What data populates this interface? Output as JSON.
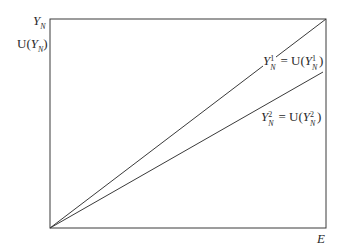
{
  "diagram": {
    "y_axis": {
      "top_label": "Y",
      "top_label_sub": "N",
      "second_label_prefix": "U(",
      "second_label_var": "Y",
      "second_label_sub": "N",
      "second_label_suffix": ")"
    },
    "x_axis": {
      "label": "E"
    },
    "lines": [
      {
        "id": "line-1",
        "label_lhs": "Y",
        "label_sup": "1",
        "label_sub": "N",
        "label_eq": " = U(",
        "label_rhs": "Y",
        "label_rhs_sup": "1",
        "label_rhs_sub": "N",
        "label_close": ")",
        "from": [
          0,
          0
        ],
        "to": [
          1,
          1
        ]
      },
      {
        "id": "line-2",
        "label_lhs": "Y",
        "label_sup": "2",
        "label_sub": "N",
        "label_eq": " = U(",
        "label_rhs": "Y",
        "label_rhs_sup": "2",
        "label_rhs_sub": "N",
        "label_close": ")",
        "from": [
          0,
          0
        ],
        "to": [
          0.985,
          0.77
        ]
      }
    ],
    "colors": {
      "stroke": "#3a3a3a",
      "background": "#ffffff"
    }
  }
}
